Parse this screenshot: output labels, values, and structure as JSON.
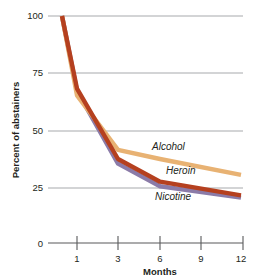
{
  "chart_data": {
    "type": "line",
    "title": "",
    "xlabel": "Months",
    "ylabel": "Percent of abstainers",
    "x": [
      0,
      1,
      3,
      6,
      12
    ],
    "categories": [
      "0",
      "1",
      "3",
      "6",
      "12"
    ],
    "xticks": [
      1,
      3,
      6,
      9,
      12
    ],
    "xtick_labels": [
      "1",
      "3",
      "6",
      "9",
      "12"
    ],
    "yticks": [
      0,
      25,
      50,
      75,
      100
    ],
    "ytick_labels": [
      "0",
      "25",
      "50",
      "75",
      "100"
    ],
    "ylim": [
      0,
      100
    ],
    "grid": "horizontal",
    "legend": "inline-labels",
    "series": [
      {
        "name": "Alcohol",
        "color": "#e8b273",
        "values": [
          100,
          65,
          41,
          37,
          30
        ],
        "label": "Alcohol"
      },
      {
        "name": "Heroin",
        "color": "#b5401f",
        "values": [
          100,
          68,
          37,
          27,
          21
        ],
        "label": "Heroin"
      },
      {
        "name": "Nicotine",
        "color": "#8b7ba8",
        "values": [
          100,
          67,
          35,
          25,
          20
        ],
        "label": "Nicotine"
      }
    ]
  },
  "axes": {
    "y_title": "Percent of abstainers",
    "x_title": "Months",
    "y_tick_0": "0",
    "y_tick_25": "25",
    "y_tick_50": "50",
    "y_tick_75": "75",
    "y_tick_100": "100",
    "x_tick_1": "1",
    "x_tick_3": "3",
    "x_tick_6": "6",
    "x_tick_9": "9",
    "x_tick_12": "12"
  },
  "labels": {
    "alcohol": "Alcohol",
    "heroin": "Heroin",
    "nicotine": "Nicotine"
  },
  "colors": {
    "alcohol": "#e8b273",
    "heroin": "#b5401f",
    "nicotine": "#8b7ba8",
    "grid": "#a7a9ac",
    "axis": "#58595b",
    "text": "#231f20",
    "background": "#ffffff"
  }
}
